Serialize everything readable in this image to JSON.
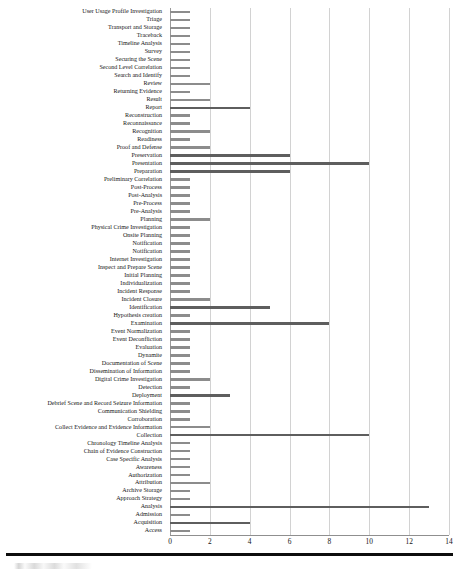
{
  "chart_data": {
    "type": "bar",
    "orientation": "horizontal",
    "title": "",
    "subtitle": "",
    "xlabel": "",
    "ylabel": "",
    "xlim": [
      0,
      14
    ],
    "xticks": [
      0,
      2,
      4,
      6,
      8,
      10,
      12,
      14
    ],
    "grid": "vertical",
    "legend": "none",
    "bar_color": "#8c8c8c",
    "bar_color_highlight": "#5e5e5e",
    "categories": [
      "User Usage Profile Investigation",
      "Triage",
      "Transport and Storage",
      "Traceback",
      "Timeline Analysis",
      "Survey",
      "Securing the Scene",
      "Second Level Correlation",
      "Search and Identify",
      "Review",
      "Returning Evidence",
      "Result",
      "Report",
      "Reconstruction",
      "Reconnaissance",
      "Recognition",
      "Readiness",
      "Proof and Defense",
      "Preservation",
      "Presentation",
      "Preparation",
      "Preliminary Correlation",
      "Post-Process",
      "Post-Analysis",
      "Pre-Process",
      "Pre-Analysis",
      "Planning",
      "Physical Crime Investigation",
      "Onsite Planning",
      "Notification",
      "Notification",
      "Internet Investigation",
      "Inspect and Prepare Scene",
      "Initial Planning",
      "Individualization",
      "Incident Response",
      "Incident Closure",
      "Identification",
      "Hypothesis creation",
      "Examination",
      "Event Normalization",
      "Event Deconfliction",
      "Evaluation",
      "Dynamite",
      "Documentation of Scene",
      "Dissemination of Information",
      "Digital Crime Investigation",
      "Detection",
      "Deployment",
      "Debrief Scene and Record Seizure Information",
      "Communication Shielding",
      "Corroboration",
      "Collect Evidence and Evidence Information",
      "Collection",
      "Chronology Timeline Analysis",
      "Chain of Evidence Construction",
      "Case Specific Analysis",
      "Awareness",
      "Authorization",
      "Attribution",
      "Archive Storage",
      "Approach Strategy",
      "Analysis",
      "Admission",
      "Acquisition",
      "Access"
    ],
    "values": [
      1,
      1,
      1,
      1,
      1,
      1,
      1,
      1,
      1,
      2,
      1,
      2,
      4,
      1,
      1,
      2,
      1,
      2,
      6,
      10,
      6,
      1,
      1,
      1,
      1,
      1,
      2,
      1,
      1,
      1,
      1,
      1,
      1,
      1,
      1,
      1,
      2,
      5,
      1,
      8,
      1,
      1,
      1,
      1,
      1,
      1,
      2,
      1,
      3,
      1,
      1,
      1,
      2,
      10,
      1,
      1,
      1,
      1,
      1,
      2,
      1,
      1,
      13,
      1,
      4,
      1
    ],
    "highlight_categories": [
      "Presentation",
      "Preservation",
      "Preparation",
      "Examination",
      "Identification",
      "Collection",
      "Analysis",
      "Report",
      "Acquisition",
      "Deployment"
    ]
  }
}
